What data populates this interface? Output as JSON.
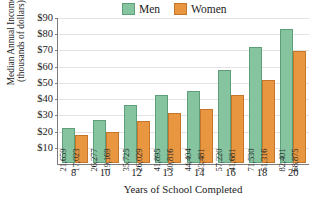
{
  "chart_data": {
    "type": "bar",
    "title": "",
    "xlabel": "Years of School Completed",
    "ylabel": "Median Annual Income (thousands of dollars)",
    "ylabel_line1": "Median Annual Income",
    "ylabel_line2": "(thousands of dollars)",
    "categories": [
      "8",
      "10",
      "12",
      "13",
      "14",
      "16",
      "18",
      "20"
    ],
    "ylim": [
      0,
      90
    ],
    "ytick_labels": [
      "$90",
      "$80",
      "$70",
      "$60",
      "$50",
      "$40",
      "$30",
      "$20",
      "$10"
    ],
    "ytick_values": [
      90,
      80,
      70,
      60,
      50,
      40,
      30,
      20,
      10
    ],
    "grid": true,
    "legend_position": "top-center",
    "series": [
      {
        "name": "Men",
        "color": "#86c39f",
        "values": [
          21659,
          26277,
          35725,
          41895,
          44404,
          57220,
          71530,
          82401
        ],
        "labels": [
          "21,659",
          "26,277",
          "35,725",
          "41,895",
          "44,404",
          "57,220",
          "71,530",
          "82,401"
        ]
      },
      {
        "name": "Women",
        "color": "#e8963f",
        "values": [
          17023,
          19169,
          26029,
          30816,
          33481,
          41681,
          51316,
          68875
        ],
        "labels": [
          "17,023",
          "19,169",
          "26,029",
          "30,816",
          "33,481",
          "41,681",
          "51,316",
          "68,875"
        ]
      }
    ]
  }
}
